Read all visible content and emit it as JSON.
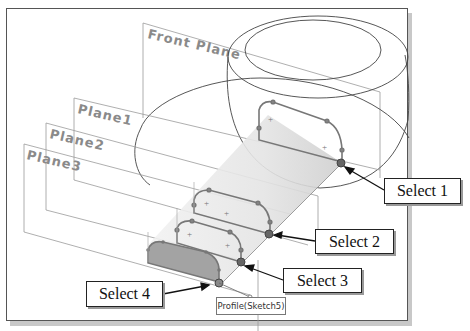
{
  "viewport": {
    "planes": [
      {
        "label": "Front Plane"
      },
      {
        "label": "Plane1"
      },
      {
        "label": "Plane2"
      },
      {
        "label": "Plane3"
      }
    ],
    "callouts": [
      {
        "label": "Select 1"
      },
      {
        "label": "Select 2"
      },
      {
        "label": "Select 3"
      },
      {
        "label": "Select 4"
      }
    ],
    "profile_tag": "Profile(Sketch5)"
  },
  "colors": {
    "frame": "#555555",
    "plane_line": "#9a9a9a",
    "sketch_line": "#777777",
    "selected_fill": "#9e9e9e",
    "point": "#555555"
  }
}
